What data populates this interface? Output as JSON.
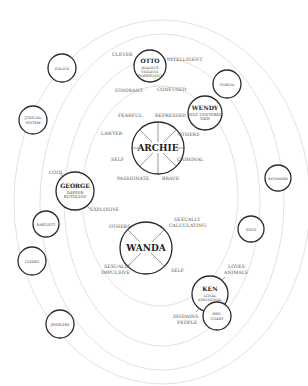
{
  "diagram": {
    "type": "character-relationship-map",
    "central_characters": [
      {
        "id": "archie",
        "name": "ARCHIE",
        "traits": [
          "FEARFUL",
          "REPRESSED",
          "OTHERS",
          "CRIMINAL",
          "BRAVE",
          "PASSIONATE",
          "SELF",
          "LAWYER"
        ]
      },
      {
        "id": "wanda",
        "name": "WANDA",
        "traits": [
          "OTHERS",
          "SEXUALLY CALCULATING",
          "SELF",
          "SEXUALLY IMPULSIVE"
        ]
      }
    ],
    "main_characters": [
      {
        "id": "otto",
        "name": "OTTO",
        "sub": [
          "JEALOUS",
          "VIOLENT",
          "PERSISTENT"
        ],
        "traits": [
          "CLEVER",
          "INTELLIGENT",
          "IGNORANT",
          "CONFUSED"
        ]
      },
      {
        "id": "wendy",
        "name": "WENDY",
        "sub": [
          "SELF CENTERED",
          "VAIN"
        ]
      },
      {
        "id": "george",
        "name": "GEORGE",
        "sub": [
          "DAPPER",
          "RUTHLESS"
        ],
        "traits": [
          "COOL",
          "EXPLOSIVE"
        ]
      },
      {
        "id": "ken",
        "name": "KEN",
        "sub": [
          "LOYAL",
          "EMOTIONAL"
        ],
        "traits": [
          "LOVES ANIMALS",
          "DISDAINS PEOPLE"
        ]
      }
    ],
    "minor_characters": [
      {
        "id": "police",
        "name": "POLICE"
      },
      {
        "id": "judicial",
        "name": "JUDICIAL SYSTEM"
      },
      {
        "id": "portia",
        "name": "PORTIA"
      },
      {
        "id": "bystander",
        "name": "BYSTANDER"
      },
      {
        "id": "bartlett",
        "name": "BARTLETT"
      },
      {
        "id": "clerks",
        "name": "CLERKS"
      },
      {
        "id": "dogs",
        "name": "DOGS"
      },
      {
        "id": "jewelers",
        "name": "JEWELERS"
      },
      {
        "id": "mrs_coady",
        "name": "MRS. COADY"
      }
    ]
  },
  "labels": {
    "archie": "ARCHIE",
    "wanda": "WANDA",
    "otto": "OTTO",
    "otto_s1": "JEALOUS",
    "otto_s2": "VIOLENT",
    "otto_s3": "PERSISTENT",
    "wendy": "WENDY",
    "wendy_s1": "SELF CENTERED",
    "wendy_s2": "VAIN",
    "george": "GEORGE",
    "george_s1": "DAPPER",
    "george_s2": "RUTHLESS",
    "ken": "KEN",
    "ken_s1": "LOYAL",
    "ken_s2": "EMOTIONAL",
    "police": "POLICE",
    "judicial_1": "JUDICIAL",
    "judicial_2": "SYSTEM",
    "portia": "PORTIA",
    "bystander": "BYSTANDER",
    "bartlett": "BARTLETT",
    "clerks": "CLERKS",
    "dogs": "DOGS",
    "jewelers": "JEWELERS",
    "mrs_1": "MRS.",
    "mrs_2": "COADY",
    "clever": "CLEVER",
    "intelligent": "INTELLIGENT",
    "ignorant": "IGNORANT",
    "confused": "CONFUSED",
    "fearful": "FEARFUL",
    "repressed": "REPRESSED",
    "others_a": "OTHERS",
    "criminal": "CRIMINAL",
    "brave": "BRAVE",
    "passionate": "PASSIONATE",
    "self_a": "SELF",
    "lawyer": "LAWYER",
    "cool": "COOL",
    "explosive": "EXPLOSIVE",
    "others_w": "OTHERS",
    "sex_calc_1": "SEXUALLY",
    "sex_calc_2": "CALCULATING",
    "self_w": "SELF",
    "sex_imp_1": "SEXUALLY",
    "sex_imp_2": "IMPULSIVE",
    "loves_1": "LOVES",
    "loves_2": "ANIMALS",
    "disdains_1": "DISDAINS",
    "disdains_2": "PEOPLE"
  }
}
